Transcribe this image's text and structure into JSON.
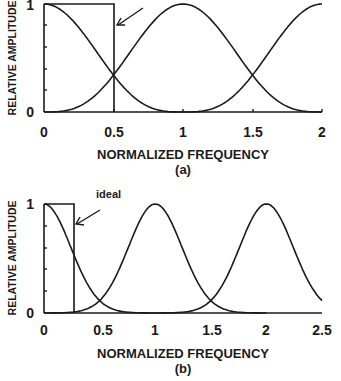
{
  "chart_data": [
    {
      "id": "a",
      "type": "line",
      "caption": "(a)",
      "xlabel": "NORMALIZED FREQUENCY",
      "ylabel": "RELATIVE AMPLITUDE",
      "xlim": [
        0,
        2
      ],
      "ylim": [
        0,
        1
      ],
      "xticks": [
        "0",
        "0.5",
        "1",
        "1.5",
        "2"
      ],
      "yticks": [
        "0",
        "1"
      ],
      "annotation": "",
      "ideal_box": {
        "x0": 0,
        "x1": 0.5,
        "height": 1
      },
      "series": [
        {
          "name": "band-0",
          "center": 0,
          "shape": "raised-cosine",
          "x": [
            0,
            0.25,
            0.5,
            0.75,
            1.0
          ],
          "values": [
            1.0,
            0.6,
            0.12,
            0.01,
            0.0
          ]
        },
        {
          "name": "band-1",
          "center": 1,
          "shape": "raised-cosine",
          "x": [
            0,
            0.5,
            0.75,
            1.0,
            1.25,
            1.5,
            2.0
          ],
          "values": [
            0.0,
            0.12,
            0.6,
            1.0,
            0.6,
            0.12,
            0.0
          ]
        },
        {
          "name": "band-2",
          "center": 2,
          "shape": "raised-cosine",
          "x": [
            1.0,
            1.5,
            1.75,
            2.0
          ],
          "values": [
            0.0,
            0.12,
            0.6,
            1.0
          ]
        }
      ],
      "grid": false
    },
    {
      "id": "b",
      "type": "line",
      "caption": "(b)",
      "xlabel": "NORMALIZED FREQUENCY",
      "ylabel": "RELATIVE AMPLITUDE",
      "xlim": [
        0,
        2.5
      ],
      "ylim": [
        0,
        1
      ],
      "xticks": [
        "0",
        "0.5",
        "1",
        "1.5",
        "2",
        "2.5"
      ],
      "yticks": [
        "0",
        "1"
      ],
      "annotation": "ideal",
      "ideal_box": {
        "x0": 0,
        "x1": 0.27,
        "height": 1
      },
      "series": [
        {
          "name": "band-0",
          "center": 0,
          "shape": "gaussian",
          "x": [
            0,
            0.25,
            0.5,
            0.75
          ],
          "values": [
            1.0,
            0.55,
            0.12,
            0.01
          ]
        },
        {
          "name": "band-1",
          "center": 1,
          "shape": "gaussian",
          "x": [
            0.25,
            0.5,
            0.75,
            1.0,
            1.25,
            1.5,
            1.75
          ],
          "values": [
            0.01,
            0.12,
            0.55,
            1.0,
            0.55,
            0.12,
            0.01
          ]
        },
        {
          "name": "band-2",
          "center": 2,
          "shape": "gaussian",
          "x": [
            1.25,
            1.5,
            1.75,
            2.0,
            2.25,
            2.5
          ],
          "values": [
            0.01,
            0.12,
            0.55,
            1.0,
            0.55,
            0.12
          ]
        }
      ],
      "grid": false
    }
  ]
}
